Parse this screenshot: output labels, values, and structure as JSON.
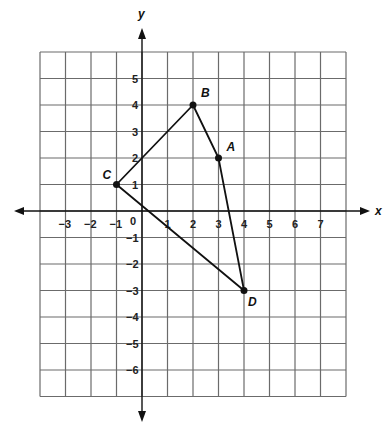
{
  "diagram": {
    "type": "coordinate-plane",
    "x_axis_label": "x",
    "y_axis_label": "y",
    "x_range": [
      -4,
      8
    ],
    "y_range": [
      -7,
      6
    ],
    "x_tick_labels": [
      "-3",
      "-2",
      "-1",
      "1",
      "2",
      "3",
      "4",
      "5",
      "6",
      "7"
    ],
    "y_tick_labels": [
      "5",
      "4",
      "3",
      "2",
      "1",
      "-1",
      "-2",
      "-3",
      "-4",
      "-5",
      "-6"
    ],
    "origin_label": "0",
    "points": [
      {
        "name": "A",
        "x": 3,
        "y": 2
      },
      {
        "name": "B",
        "x": 2,
        "y": 4
      },
      {
        "name": "C",
        "x": -1,
        "y": 1
      },
      {
        "name": "D",
        "x": 4,
        "y": -3
      }
    ],
    "polygon_order": [
      "C",
      "B",
      "A",
      "D"
    ],
    "colors": {
      "grid": "#6b6b6b",
      "axis": "#111111",
      "shape": "#111111"
    }
  }
}
